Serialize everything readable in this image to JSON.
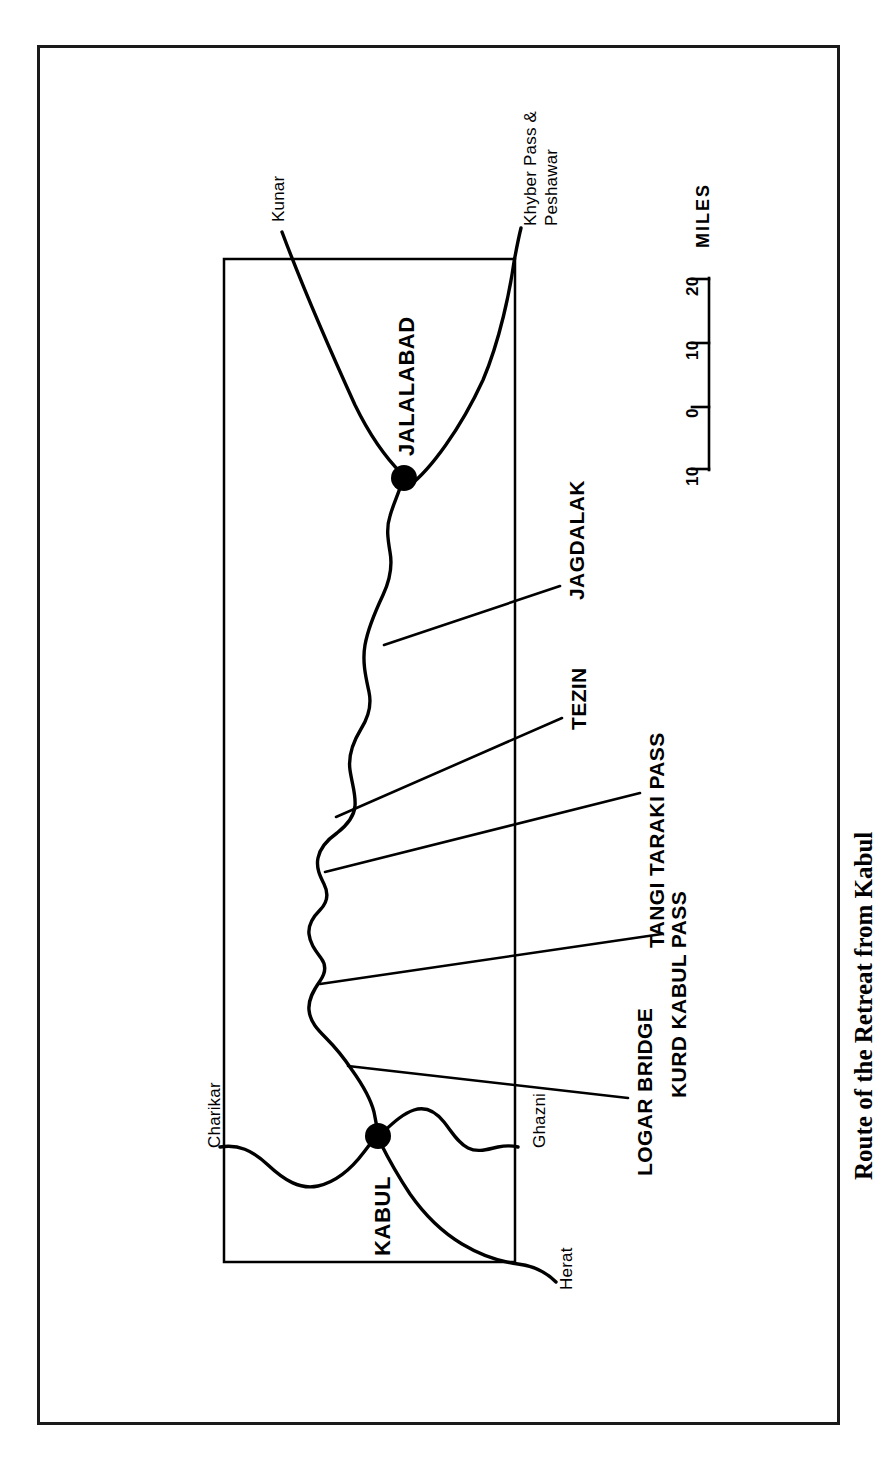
{
  "figure": {
    "caption": "Route of the Retreat from Kabul",
    "orientation": "rotated-90-ccw"
  },
  "map": {
    "cities": [
      {
        "name": "JALALABAD",
        "x": 404,
        "y": 478
      },
      {
        "name": "KABUL",
        "x": 378,
        "y": 1136
      }
    ],
    "off_map_places": [
      {
        "name": "Kunar"
      },
      {
        "name": "Khyber Pass &"
      },
      {
        "name": "Peshawar"
      },
      {
        "name": "Charikar"
      },
      {
        "name": "Ghazni"
      },
      {
        "name": "Herat"
      }
    ],
    "route_features": [
      {
        "name": "JAGDALAK"
      },
      {
        "name": "TEZIN"
      },
      {
        "name": "TANGI TARAKI PASS"
      },
      {
        "name": "KURD KABUL PASS"
      },
      {
        "name": "LOGAR BRIDGE"
      }
    ],
    "scale": {
      "unit_label": "MILES",
      "ticks": [
        "20",
        "10",
        "0",
        "10"
      ]
    },
    "colors": {
      "ink": "#000000",
      "frame": "#1a1a1a",
      "paper": "#ffffff"
    }
  }
}
